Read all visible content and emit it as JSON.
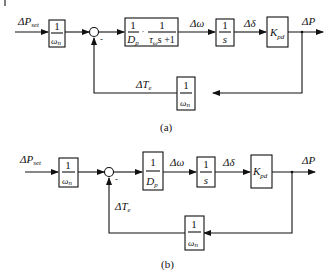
{
  "diagram_a": {
    "caption": "(a)",
    "input_label": "ΔP",
    "input_sub": "set",
    "block1": {
      "num": "1",
      "den": "ω",
      "den_sub": "n"
    },
    "sum_sign": "-",
    "block2": {
      "num1": "1",
      "den1": "D",
      "den1_sub": "p",
      "dot": "·",
      "num2": "1",
      "den2_pre": "τ",
      "den2_sub": "ω",
      "den2_post": "s +1"
    },
    "signal_omega": "Δω",
    "block3": {
      "num": "1",
      "den": "s"
    },
    "signal_delta": "Δδ",
    "block4": {
      "label": "K",
      "label_sub": "pd"
    },
    "output_label": "ΔP",
    "feedback_block": {
      "num": "1",
      "den": "ω",
      "den_sub": "n"
    },
    "feedback_label": "ΔT",
    "feedback_sub": "e"
  },
  "diagram_b": {
    "caption": "(b)",
    "input_label": "ΔP",
    "input_sub": "set",
    "block1": {
      "num": "1",
      "den": "ω",
      "den_sub": "n"
    },
    "sum_sign": "-",
    "block2": {
      "num": "1",
      "den": "D",
      "den_sub": "p"
    },
    "signal_omega": "Δω",
    "block3": {
      "num": "1",
      "den": "s"
    },
    "signal_delta": "Δδ",
    "block4": {
      "label": "K",
      "label_sub": "pd"
    },
    "output_label": "ΔP",
    "feedback_block": {
      "num": "1",
      "den": "ω",
      "den_sub": "n"
    },
    "feedback_label": "ΔT",
    "feedback_sub": "e"
  }
}
